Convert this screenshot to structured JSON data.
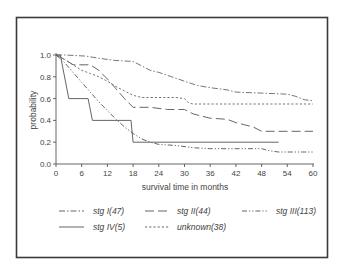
{
  "chart_data": {
    "type": "line",
    "subtype": "kaplan-meier survival curves",
    "title": "",
    "xlabel": "survival time in months",
    "ylabel": "probability",
    "xlim": [
      0,
      60
    ],
    "ylim": [
      0.0,
      1.0
    ],
    "xticks": [
      0,
      6,
      12,
      18,
      24,
      30,
      36,
      42,
      48,
      54,
      60
    ],
    "yticks": [
      0.0,
      0.2,
      0.4,
      0.6,
      0.8,
      1.0
    ],
    "xtick_labels": [
      "0",
      "6",
      "12",
      "18",
      "24",
      "30",
      "36",
      "42",
      "48",
      "54",
      "60"
    ],
    "ytick_labels": [
      "0.0",
      "0.2",
      "0.4",
      "0.6",
      "0.8",
      "1.0"
    ],
    "grid": false,
    "legend_position": "bottom",
    "series": [
      {
        "name": "stg I(47)",
        "style": "dash-dot",
        "color": "#666666",
        "x": [
          0,
          2,
          7,
          10,
          14,
          18,
          20,
          22,
          24,
          27,
          30,
          33,
          36,
          40,
          42,
          48,
          54,
          56,
          58,
          60
        ],
        "y": [
          1.0,
          1.0,
          0.99,
          0.97,
          0.95,
          0.94,
          0.9,
          0.86,
          0.84,
          0.8,
          0.76,
          0.72,
          0.7,
          0.68,
          0.66,
          0.65,
          0.64,
          0.62,
          0.59,
          0.58
        ]
      },
      {
        "name": "stg II(44)",
        "style": "long-dash",
        "color": "#555555",
        "x": [
          0,
          2,
          4,
          8,
          10,
          12,
          14,
          16,
          18,
          22,
          26,
          30,
          32,
          36,
          40,
          42,
          44,
          46,
          48,
          60
        ],
        "y": [
          1.0,
          0.96,
          0.91,
          0.91,
          0.86,
          0.78,
          0.69,
          0.6,
          0.52,
          0.52,
          0.5,
          0.5,
          0.46,
          0.42,
          0.41,
          0.38,
          0.36,
          0.34,
          0.3,
          0.3
        ]
      },
      {
        "name": "stg III(113)",
        "style": "dash-dot-dot",
        "color": "#555555",
        "x": [
          0,
          2,
          4,
          6,
          8,
          10,
          12,
          14,
          16,
          18,
          20,
          22,
          24,
          28,
          32,
          36,
          42,
          48,
          50,
          52,
          60
        ],
        "y": [
          1.0,
          0.93,
          0.84,
          0.75,
          0.66,
          0.57,
          0.49,
          0.41,
          0.34,
          0.28,
          0.23,
          0.2,
          0.18,
          0.17,
          0.15,
          0.14,
          0.14,
          0.14,
          0.12,
          0.11,
          0.11
        ]
      },
      {
        "name": "stg IV(5)",
        "style": "solid",
        "color": "#555555",
        "x": [
          0,
          1,
          3,
          7.5,
          8.5,
          17.5,
          18,
          52
        ],
        "y": [
          1.0,
          1.0,
          0.6,
          0.6,
          0.4,
          0.4,
          0.2,
          0.2
        ]
      },
      {
        "name": "unknown(38)",
        "style": "dotted",
        "color": "#666666",
        "x": [
          0,
          2,
          4,
          6,
          8,
          10,
          12,
          14,
          16,
          18,
          20,
          24,
          28,
          30,
          31,
          32,
          60
        ],
        "y": [
          1.0,
          0.96,
          0.91,
          0.86,
          0.83,
          0.8,
          0.76,
          0.71,
          0.67,
          0.63,
          0.61,
          0.61,
          0.61,
          0.6,
          0.56,
          0.55,
          0.55
        ]
      }
    ]
  },
  "legend": {
    "items": [
      {
        "label": "stg I(47)",
        "style": "dash-dot"
      },
      {
        "label": "stg II(44)",
        "style": "long-dash"
      },
      {
        "label": "stg III(113)",
        "style": "dash-dot-dot"
      },
      {
        "label": "stg IV(5)",
        "style": "solid"
      },
      {
        "label": "unknown(38)",
        "style": "dotted"
      }
    ]
  },
  "styles": {
    "dash-dot": "6 2 1.5 2",
    "long-dash": "9 4",
    "dash-dot-dot": "5 2 1.2 2 1.2 2",
    "solid": "",
    "dotted": "2.2 2"
  }
}
